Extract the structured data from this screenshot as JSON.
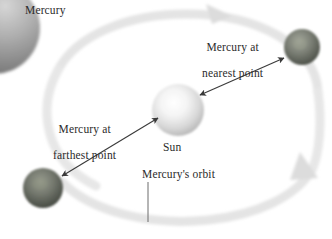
{
  "figure": {
    "kind": "astronomy-diagram",
    "background_color": "#ffffff"
  },
  "labels": {
    "corner_planet": "Mercury",
    "nearest_point_line1": "Mercury at",
    "nearest_point_line2": "nearest point",
    "farthest_point_line1": "Mercury at",
    "farthest_point_line2": "farthest point",
    "sun": "Sun",
    "orbit": "Mercury's orbit"
  },
  "bodies": {
    "sun": {
      "name": "Sun",
      "center_x": 178,
      "center_y": 110,
      "radius": 26,
      "color_core": "#fdfdfd",
      "color_edge": "#b9b9b9"
    },
    "mercury_near": {
      "name": "Mercury at nearest point",
      "center_x": 302,
      "center_y": 47,
      "radius": 18,
      "color_core": "#8c9086",
      "color_edge": "#4b4f48"
    },
    "mercury_far": {
      "name": "Mercury at farthest point",
      "center_x": 43,
      "center_y": 188,
      "radius": 20,
      "color_core": "#7f8379",
      "color_edge": "#43473f"
    },
    "corner_planet": {
      "name": "Mercury surface closeup",
      "center_x": -6,
      "center_y": 28,
      "radius": 45,
      "color_core": "#c9c9c9",
      "color_edge": "#6f6f6f"
    }
  },
  "orbit": {
    "color_band": "#e2e2e2",
    "band_width": 9,
    "direction": "counterclockwise",
    "arrowheads": 2
  },
  "connectors": {
    "sun_to_near": {
      "style": "double-headed-arrow",
      "color": "#3a3a3a",
      "from_x": 202,
      "from_y": 93,
      "to_x": 285,
      "to_y": 57
    },
    "sun_to_far": {
      "style": "double-headed-arrow",
      "color": "#3a3a3a",
      "from_x": 157,
      "from_y": 117,
      "to_x": 60,
      "to_y": 177
    },
    "orbit_leader": {
      "style": "plain-line",
      "color": "#6a6a6a",
      "from_x": 148,
      "from_y": 182,
      "to_x": 148,
      "to_y": 222
    }
  }
}
